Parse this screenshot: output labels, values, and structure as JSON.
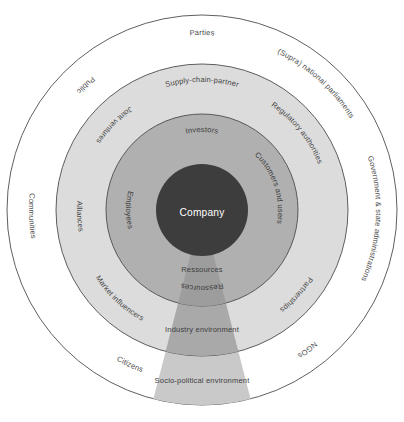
{
  "diagram": {
    "type": "concentric-rings",
    "center": {
      "label": "Company"
    },
    "colors": {
      "background": "#ffffff",
      "outer_ring_fill": "#ffffff",
      "light_ring_fill": "#dcdcdc",
      "mid_ring_fill": "#b0b0b0",
      "center_fill": "#3d3d3d",
      "wedge_outer_fill": "#c9c9c9",
      "wedge_mid_fill": "#a0a0a0",
      "wedge_inner_fill": "#9a9a9a",
      "stroke": "#4d4d4d",
      "label_text": "#4a4a4a",
      "center_text": "#ffffff"
    },
    "geometry": {
      "center_x": 202,
      "center_y": 210,
      "r_outer": 195,
      "r_light": 146,
      "r_mid": 96,
      "r_center": 46
    },
    "rings": [
      {
        "name": "socio-political-environment",
        "fill_key": "outer_ring_fill",
        "labels": [
          {
            "text": "Parties",
            "angle": -90,
            "radius": 175,
            "flip": false
          },
          {
            "text": "(Supra) national parliaments",
            "angle": -48,
            "radius": 174,
            "flip": false
          },
          {
            "text": "Government & state administrations",
            "angle": 3,
            "radius": 174,
            "flip": false
          },
          {
            "text": "NGOs",
            "angle": 53,
            "radius": 173,
            "flip": false
          },
          {
            "text": "Citizens",
            "angle": 115,
            "radius": 173,
            "flip": true
          },
          {
            "text": "Communities",
            "angle": 178,
            "radius": 173,
            "flip": true
          },
          {
            "text": "Public",
            "angle": -133,
            "radius": 173,
            "flip": true
          }
        ]
      },
      {
        "name": "industry-environment",
        "fill_key": "light_ring_fill",
        "labels": [
          {
            "text": "Supply-chain-partner",
            "angle": -90,
            "radius": 128,
            "flip": false
          },
          {
            "text": "Regulatory authorities",
            "angle": -39,
            "radius": 125,
            "flip": false
          },
          {
            "text": "Partnerships",
            "angle": 42,
            "radius": 126,
            "flip": false
          },
          {
            "text": "Market influencers",
            "angle": 133,
            "radius": 126,
            "flip": true
          },
          {
            "text": "Alliances",
            "angle": 177,
            "radius": 125,
            "flip": true
          },
          {
            "text": "Joint ventures",
            "angle": -136,
            "radius": 126,
            "flip": true
          }
        ]
      },
      {
        "name": "direct-stakeholders",
        "fill_key": "mid_ring_fill",
        "labels": [
          {
            "text": "Investors",
            "angle": -90,
            "radius": 78,
            "flip": false
          },
          {
            "text": "Customers and users",
            "angle": -18,
            "radius": 76,
            "flip": false
          },
          {
            "text": "Ressources",
            "angle": 90,
            "radius": 76,
            "flip": false
          },
          {
            "text": "Employees",
            "angle": 180,
            "radius": 76,
            "flip": true
          }
        ]
      }
    ],
    "wedge": {
      "name": "resource-flow-wedge",
      "labels": [
        {
          "text": "Ressources",
          "x": 202,
          "y": 272
        },
        {
          "text": "Industry environment",
          "x": 202,
          "y": 332
        },
        {
          "text": "Socio-political environment",
          "x": 202,
          "y": 383
        }
      ]
    }
  }
}
